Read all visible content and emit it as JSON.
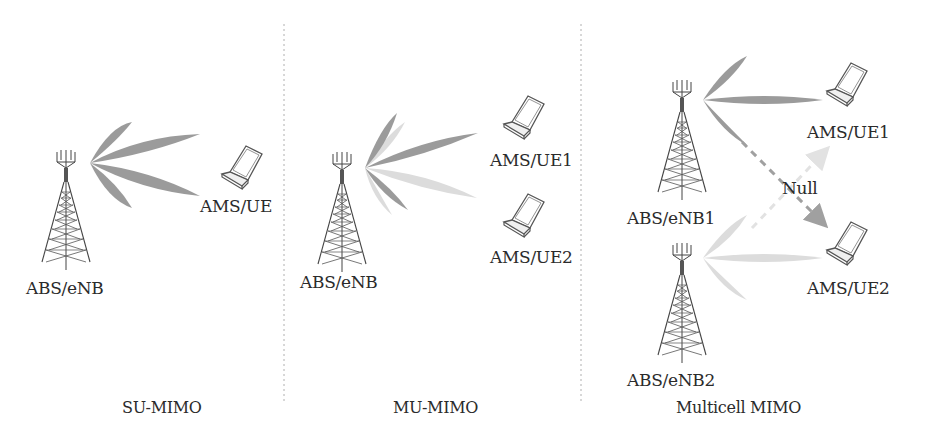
{
  "colors": {
    "beam_dark": "#9b9b9b",
    "beam_light": "#dcdcdc",
    "tower": "#444444",
    "text": "#2b2b2b",
    "separator": "#b0b0b0"
  },
  "panels": [
    {
      "caption": "SU-MIMO",
      "base_station": "ABS/eNB",
      "users": [
        "AMS/UE"
      ]
    },
    {
      "caption": "MU-MIMO",
      "base_station": "ABS/eNB",
      "users": [
        "AMS/UE1",
        "AMS/UE2"
      ]
    },
    {
      "caption": "Multicell MIMO",
      "base_stations": [
        "ABS/eNB1",
        "ABS/eNB2"
      ],
      "users": [
        "AMS/UE1",
        "AMS/UE2"
      ],
      "null_label": "Null"
    }
  ]
}
